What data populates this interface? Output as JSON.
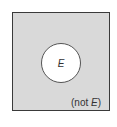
{
  "diagram": {
    "type": "venn",
    "universe_fill": "#d9d9d9",
    "event": {
      "label": "E",
      "fill": "#ffffff"
    },
    "complement": {
      "prefix": "(not ",
      "label": "E",
      "suffix": ")"
    }
  }
}
